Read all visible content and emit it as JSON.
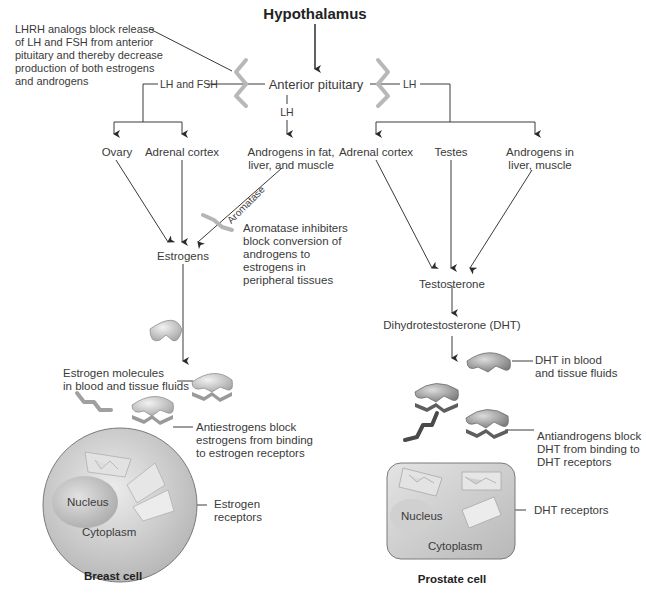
{
  "title": "Hypothalamus",
  "anterior_pituitary": "Anterior pituitary",
  "lhrh_note": "LHRH analogs block release\nof LH and FSH from anterior\npituitary and thereby decrease\nproduction of both estrogens\nand androgens",
  "left": {
    "branch_label": "LH and FSH",
    "center_lh_label": "LH",
    "sources": [
      "Ovary",
      "Adrenal cortex",
      "Androgens in fat,\nliver, and muscle"
    ],
    "aromatase_label": "Aromatase",
    "aromatase_inhibitor_note": "Aromatase inhibiters\nblock conversion of\nandrogens to\nestrogens in\nperipheral tissues",
    "hormone": "Estrogens",
    "molecules_note": "Estrogen molecules\nin blood and tissue fluids",
    "antagonist_note": "Antiestrogens block\nestrogens from binding\nto estrogen receptors",
    "cell": {
      "nucleus": "Nucleus",
      "cytoplasm": "Cytoplasm",
      "receptors_note": "Estrogen\nreceptors",
      "name": "Breast cell"
    }
  },
  "right": {
    "branch_label": "LH",
    "sources": [
      "Adrenal cortex",
      "Testes",
      "Androgens in\nliver, muscle"
    ],
    "hormone": "Testosterone",
    "converted": "Dihydrotestosterone (DHT)",
    "molecules_note": "DHT in blood\nand tissue fluids",
    "antagonist_note": "Antiandrogens block\nDHT from binding to\nDHT receptors",
    "cell": {
      "nucleus": "Nucleus",
      "cytoplasm": "Cytoplasm",
      "receptors_note": "DHT receptors",
      "name": "Prostate cell"
    }
  },
  "colors": {
    "line": "#3a3a3a",
    "blocker": "#b5b5b5",
    "molecule": "#cfcfcf",
    "dht_molecule": "#a9a9a9",
    "cell_fill": "#d6d6d6"
  }
}
